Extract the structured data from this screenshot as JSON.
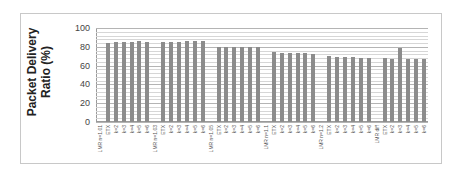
{
  "chart_data": {
    "type": "bar",
    "title": "",
    "xlabel": "",
    "ylabel": "Packet Delivery Ratio (%)",
    "ylabel_lines": [
      "Packet Delivery",
      "Ratio (%)"
    ],
    "ylim": [
      0,
      100
    ],
    "yticks": [
      0,
      20,
      40,
      60,
      80,
      100
    ],
    "grid": true,
    "legend": null,
    "groups": [
      {
        "name": "LMR n=1.01",
        "categories": [
          "ETX",
          "k=2",
          "k=3",
          "k=4",
          "k=5",
          "k=6"
        ],
        "values": [
          84,
          85,
          85,
          85,
          86,
          85
        ]
      },
      {
        "name": "LMR n=1.03",
        "categories": [
          "ETX",
          "k=2",
          "k=3",
          "k=4",
          "k=5",
          "k=6"
        ],
        "values": [
          85,
          85,
          85,
          86,
          86,
          86
        ]
      },
      {
        "name": "LMR n=1.05",
        "categories": [
          "ETX",
          "k=2",
          "k=3",
          "k=4",
          "k=5",
          "k=6"
        ],
        "values": [
          80,
          80,
          80,
          80,
          80,
          80
        ]
      },
      {
        "name": "LMR n=1.1",
        "categories": [
          "ETX",
          "k=2",
          "k=3",
          "k=4",
          "k=5",
          "k=6"
        ],
        "values": [
          74,
          73,
          73,
          73,
          73,
          72
        ]
      },
      {
        "name": "LMR n=1.2",
        "categories": [
          "ETX",
          "k=2",
          "k=3",
          "k=4",
          "k=5",
          "k=6"
        ],
        "values": [
          70,
          69,
          69,
          69,
          68,
          68
        ]
      },
      {
        "name": "LMR diff",
        "categories": [
          "ETX",
          "k=2",
          "k=3",
          "k=4",
          "k=5",
          "k=6"
        ],
        "values": [
          68,
          67,
          79,
          67,
          67,
          67
        ]
      }
    ],
    "categories": [
      "LMR n=1.01",
      "ETX",
      "k=2",
      "k=3",
      "k=4",
      "k=5",
      "k=6",
      "LMR n=1.03",
      "ETX",
      "k=2",
      "k=3",
      "k=4",
      "k=5",
      "k=6",
      "LMR n=1.05",
      "ETX",
      "k=2",
      "k=3",
      "k=4",
      "k=5",
      "k=6",
      "LMR n=1.1",
      "ETX",
      "k=2",
      "k=3",
      "k=4",
      "k=5",
      "k=6",
      "LMR n=1.2",
      "ETX",
      "k=2",
      "k=3",
      "k=4",
      "k=5",
      "k=6",
      "LMR diff",
      "ETX",
      "k=2",
      "k=3",
      "k=4",
      "k=5",
      "k=6"
    ],
    "values": [
      null,
      84,
      85,
      85,
      85,
      86,
      85,
      null,
      85,
      85,
      85,
      86,
      86,
      86,
      null,
      80,
      80,
      80,
      80,
      80,
      80,
      null,
      74,
      73,
      73,
      73,
      73,
      72,
      null,
      70,
      69,
      69,
      69,
      68,
      68,
      null,
      68,
      67,
      79,
      67,
      67,
      67
    ],
    "bar_color": "#8c8c8c"
  }
}
